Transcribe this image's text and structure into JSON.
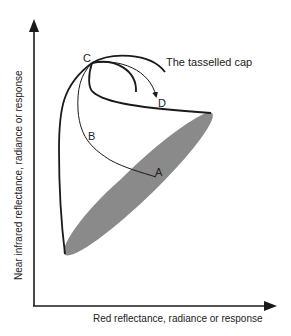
{
  "diagram": {
    "title": "The tasselled cap",
    "x_axis_label": "Red reflectance, radiance or response",
    "y_axis_label": "Near infrared reflectance, radiance or response",
    "points": {
      "A": "A",
      "B": "B",
      "C": "C",
      "D": "D"
    },
    "colors": {
      "line": "#1a1a1a",
      "soil_line_fill": "#8a8a8a",
      "background": "#ffffff"
    }
  }
}
